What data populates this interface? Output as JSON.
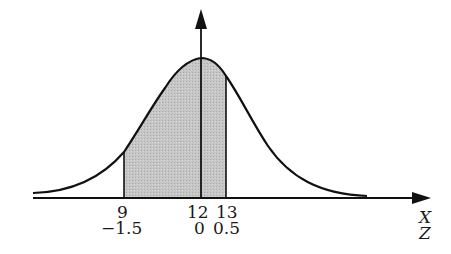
{
  "diagram": {
    "type": "normal-distribution",
    "shaded_region": {
      "from_x": 9,
      "to_x": 13,
      "fill": "#c4c4c4"
    },
    "curve_color": "#111111",
    "mean": {
      "x": 12,
      "z": 0
    },
    "ticks": [
      {
        "x": "9",
        "z": "−1.5"
      },
      {
        "x": "12",
        "z": "0"
      },
      {
        "x": "13",
        "z": "0.5"
      }
    ],
    "axis_labels": {
      "x": "X",
      "z": "Z"
    }
  }
}
